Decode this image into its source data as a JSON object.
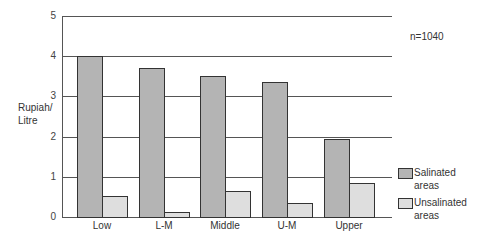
{
  "chart_data": {
    "type": "bar",
    "title": "",
    "xlabel": "",
    "ylabel": "Rupiah/ Litre",
    "ylim": [
      0,
      5
    ],
    "yticks": [
      "0",
      "1",
      "2",
      "3",
      "4",
      "5"
    ],
    "categories": [
      "Low",
      "L-M",
      "Middle",
      "U-M",
      "Upper"
    ],
    "series": [
      {
        "name": "Salinated areas",
        "color": "#b4b4b4",
        "values": [
          4.0,
          3.7,
          3.5,
          3.35,
          1.95
        ]
      },
      {
        "name": "Unsalinated areas",
        "color": "#dedede",
        "values": [
          0.52,
          0.12,
          0.65,
          0.35,
          0.85
        ]
      }
    ],
    "annotation": "n=1040",
    "grid": true,
    "legend_position": "right-bottom"
  },
  "labels": {
    "ylabel_line1": "Rupiah/",
    "ylabel_line2": "Litre",
    "annotation": "n=1040",
    "legend": [
      {
        "line1": "Salinated",
        "line2": "areas"
      },
      {
        "line1": "Unsalinated",
        "line2": "areas"
      }
    ]
  }
}
